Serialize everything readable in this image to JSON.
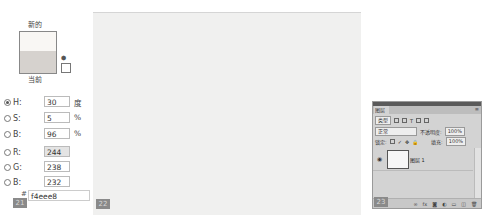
{
  "panels": [
    {
      "number": "21",
      "type": "color-picker"
    },
    {
      "number": "22",
      "type": "canvas"
    },
    {
      "number": "23",
      "type": "layers-panel"
    }
  ],
  "color_picker": {
    "new_label": "新的",
    "current_label": "当前",
    "new_color": "#f9f7f4",
    "current_color": "#d6d2ce",
    "fields": [
      {
        "id": "H",
        "label": "H:",
        "value": "30",
        "unit": "度",
        "selected": true
      },
      {
        "id": "S",
        "label": "S:",
        "value": "5",
        "unit": "%",
        "selected": false
      },
      {
        "id": "B",
        "label": "B:",
        "value": "96",
        "unit": "%",
        "selected": false
      },
      {
        "id": "R",
        "label": "R:",
        "value": "244",
        "unit": "",
        "selected": false
      },
      {
        "id": "G",
        "label": "G:",
        "value": "238",
        "unit": "",
        "selected": false
      },
      {
        "id": "Bl",
        "label": "B:",
        "value": "232",
        "unit": "",
        "selected": false
      }
    ],
    "hash": "#",
    "hex_value": "f4eee8"
  },
  "canvas": {
    "fill_color": "#f0f0ef"
  },
  "layers_panel": {
    "tab_label": "图层",
    "kind_filter": "类型",
    "blend_mode": "正常",
    "opacity_label": "不透明度:",
    "opacity_value": "100%",
    "lock_label": "锁定:",
    "fill_label": "填充:",
    "fill_value": "100%",
    "layer_name": "图层 1",
    "menu_icon": "≡",
    "eye_icon": "👁"
  }
}
